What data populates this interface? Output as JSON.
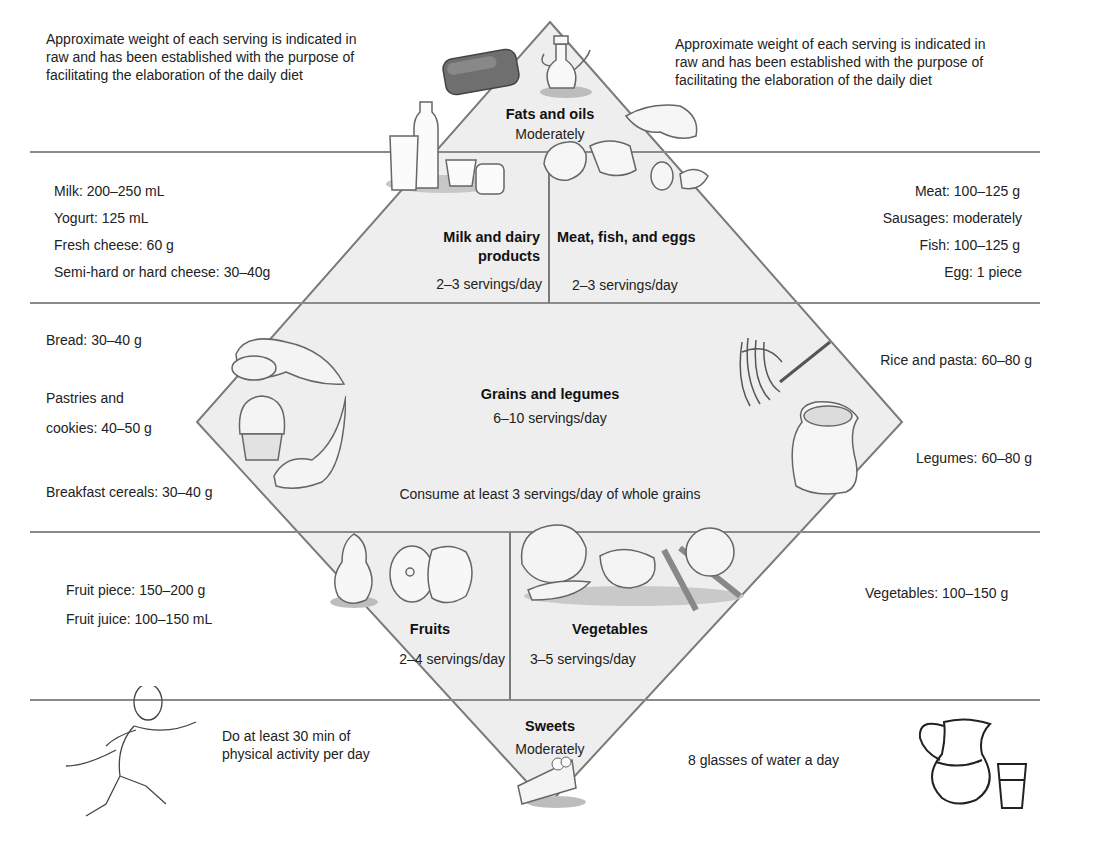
{
  "notes": {
    "top_left": "Approximate weight of each serving is indicated in raw and has been established with the purpose of facilitating the elaboration of the daily diet",
    "top_left_lines": [
      "Approximate weight of each serving is indicated in",
      "raw and has been established with the purpose of",
      "facilitating the elaboration of the daily diet"
    ],
    "top_right_lines": [
      "Approximate weight of each serving is indicated in",
      "raw and has been established with the purpose of",
      "facilitating the elaboration of the daily diet"
    ]
  },
  "tiers": {
    "fats": {
      "title": "Fats and oils",
      "subtitle": "Moderately"
    },
    "dairy": {
      "title_line1": "Milk and dairy",
      "title_line2": "products",
      "servings": "2–3 servings/day",
      "items": [
        "Milk: 200–250 mL",
        "Yogurt: 125 mL",
        "Fresh cheese: 60 g",
        "Semi-hard or hard cheese: 30–40g"
      ]
    },
    "meat": {
      "title": "Meat, fish, and eggs",
      "servings": "2–3 servings/day",
      "items": [
        "Meat: 100–125 g",
        "Sausages: moderately",
        "Fish: 100–125 g",
        "Egg: 1 piece"
      ]
    },
    "grains": {
      "title": "Grains and legumes",
      "servings": "6–10 servings/day",
      "note": "Consume at least 3 servings/day of whole grains",
      "left_items": [
        "Bread: 30–40 g",
        "Pastries and",
        "cookies: 40–50 g",
        "Breakfast cereals: 30–40 g"
      ],
      "right_items": [
        "Rice and pasta: 60–80 g",
        "Legumes: 60–80 g"
      ]
    },
    "fruits": {
      "title": "Fruits",
      "servings": "2–4 servings/day",
      "items": [
        "Fruit piece: 150–200 g",
        "Fruit juice: 100–150 mL"
      ]
    },
    "vegetables": {
      "title": "Vegetables",
      "servings": "3–5 servings/day",
      "items": [
        "Vegetables: 100–150 g"
      ]
    },
    "sweets": {
      "title": "Sweets",
      "subtitle": "Moderately"
    }
  },
  "footer": {
    "activity_line1": "Do at least 30 min of",
    "activity_line2": "physical activity per day",
    "water": "8 glasses of water a day"
  },
  "icons": [
    "butter-icon",
    "oil-cruet-icon",
    "milk-bottle-icon",
    "glass-icon",
    "yogurt-icon",
    "jar-icon",
    "chicken-icon",
    "fish-icon",
    "egg-icon",
    "bread-icon",
    "muffin-icon",
    "cereal-spoon-icon",
    "pasta-fork-icon",
    "legume-sack-icon",
    "pear-icon",
    "apple-icon",
    "cauliflower-icon",
    "carrot-icon",
    "tomato-icon",
    "cake-slice-icon",
    "runner-icon",
    "water-pitcher-icon",
    "water-glass-icon"
  ],
  "colors": {
    "diamond_fill": "#eeeeee",
    "line": "#7a7a7a",
    "text": "#222222",
    "background": "#ffffff"
  }
}
